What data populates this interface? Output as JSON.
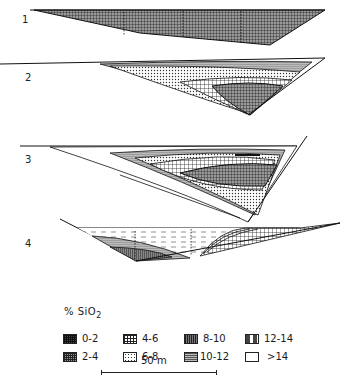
{
  "figure": {
    "sections": [
      {
        "id": "1",
        "label": "1"
      },
      {
        "id": "2",
        "label": "2"
      },
      {
        "id": "3",
        "label": "3"
      },
      {
        "id": "4",
        "label": "4"
      }
    ]
  },
  "legend": {
    "title": "% SiO",
    "title_subscript": "2",
    "items": [
      {
        "label": "0-2",
        "pattern": "dense-grid-dark"
      },
      {
        "label": "2-4",
        "pattern": "grid-medium"
      },
      {
        "label": "4-6",
        "pattern": "open-grid"
      },
      {
        "label": "6-8",
        "pattern": "dotted-grid-light"
      },
      {
        "label": "8-10",
        "pattern": "vertical-lines"
      },
      {
        "label": "10-12",
        "pattern": "horizontal-lines"
      },
      {
        "label": "12-14",
        "pattern": "dashes"
      },
      {
        "label": ">14",
        "pattern": "blank"
      }
    ]
  },
  "scale_bar": {
    "label": "50 m"
  }
}
